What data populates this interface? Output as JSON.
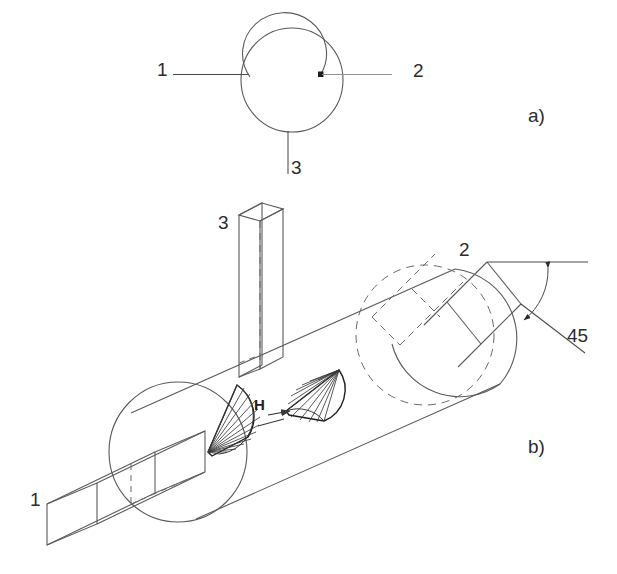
{
  "figure": {
    "background_color": "#ffffff",
    "line_color": "#4a4a4a",
    "text_color": "#2b2b2b",
    "width": 617,
    "height": 574
  },
  "view_a": {
    "panel_label": "a)",
    "callout_1": "1",
    "callout_2": "2",
    "callout_3": "3"
  },
  "view_b": {
    "panel_label": "b)",
    "callout_1": "1",
    "callout_2": "2",
    "callout_3": "3",
    "dimension_h": "H",
    "angle_value": "45"
  }
}
